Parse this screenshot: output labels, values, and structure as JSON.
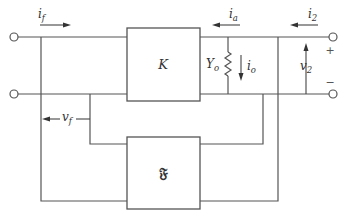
{
  "diagram": {
    "blocks": {
      "amplifier": {
        "label": "K"
      },
      "feedback": {
        "label": "𝔉"
      }
    },
    "components": {
      "output_admittance": {
        "label": "Y",
        "subscript": "o"
      }
    },
    "currents": {
      "feedback_current": {
        "label": "i",
        "subscript": "f"
      },
      "amplifier_current": {
        "label": "i",
        "subscript": "a"
      },
      "output_current": {
        "label": "i",
        "subscript": "2"
      },
      "admittance_current": {
        "label": "i",
        "subscript": "o"
      }
    },
    "voltages": {
      "feedback_voltage": {
        "label": "v",
        "subscript": "f"
      },
      "output_voltage": {
        "label": "v",
        "subscript": "2"
      }
    },
    "polarity": {
      "plus": "+",
      "minus": "−"
    }
  }
}
